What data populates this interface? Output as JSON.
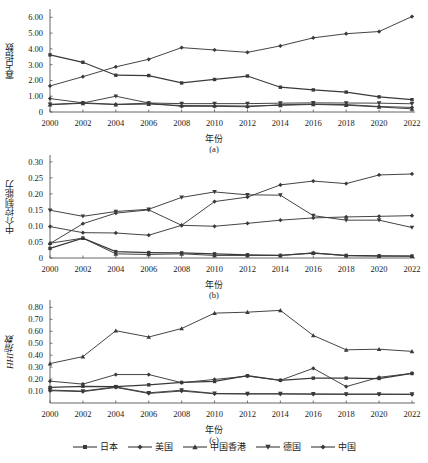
{
  "figure": {
    "background": "#ffffff",
    "line_color": "#3a3a3a",
    "axis_color": "#555555"
  },
  "legend": {
    "position": "bottom-center",
    "items": [
      {
        "label": "日本",
        "marker": "square",
        "series_key": "japan"
      },
      {
        "label": "美国",
        "marker": "diamond",
        "series_key": "usa"
      },
      {
        "label": "中国香港",
        "marker": "triangle-up",
        "series_key": "hongkong"
      },
      {
        "label": "德国",
        "marker": "triangle-down",
        "series_key": "germany"
      },
      {
        "label": "中国",
        "marker": "diamond",
        "series_key": "china"
      }
    ]
  },
  "chart_data": [
    {
      "id": "a",
      "type": "line",
      "title": "",
      "subplot_label": "(a)",
      "xlabel": "年份",
      "ylabel": "寡占指数",
      "ylabel_italic": false,
      "grid": false,
      "legend_position": "bottom-shared",
      "x": [
        2000,
        2002,
        2004,
        2006,
        2008,
        2010,
        2012,
        2014,
        2016,
        2018,
        2020,
        2022
      ],
      "xtick_labels": [
        "2000",
        "2002",
        "2004",
        "2006",
        "2008",
        "2010",
        "2012",
        "2014",
        "2016",
        "2018",
        "2020",
        "2022"
      ],
      "ylim": [
        0,
        6.4
      ],
      "ytick_values": [
        0,
        1.0,
        2.0,
        3.0,
        4.0,
        5.0,
        6.0
      ],
      "ytick_labels": [
        "0",
        "1.00",
        "2.00",
        "3.00",
        "4.00",
        "5.00",
        "6.00"
      ],
      "series": [
        {
          "name": "日本",
          "key": "japan",
          "marker": "square",
          "values": [
            3.62,
            3.15,
            2.33,
            2.31,
            1.84,
            2.06,
            2.28,
            1.57,
            1.4,
            1.26,
            0.96,
            0.78
          ]
        },
        {
          "name": "美国",
          "key": "usa",
          "marker": "diamond",
          "values": [
            0.85,
            0.58,
            0.49,
            0.56,
            0.36,
            0.36,
            0.33,
            0.46,
            0.5,
            0.47,
            0.35,
            0.29
          ]
        },
        {
          "name": "中国香港",
          "key": "hongkong",
          "marker": "triangle-up",
          "values": [
            0.46,
            0.55,
            0.47,
            0.5,
            0.41,
            0.4,
            0.38,
            0.42,
            0.48,
            0.43,
            0.32,
            0.2
          ]
        },
        {
          "name": "德国",
          "key": "germany",
          "marker": "triangle-down",
          "values": [
            0.49,
            0.57,
            1.0,
            0.57,
            0.53,
            0.53,
            0.53,
            0.56,
            0.58,
            0.57,
            0.56,
            0.52
          ]
        },
        {
          "name": "中国",
          "key": "china",
          "marker": "diamond",
          "values": [
            1.65,
            2.24,
            2.86,
            3.34,
            4.08,
            3.93,
            3.78,
            4.19,
            4.7,
            4.96,
            5.1,
            6.05
          ]
        }
      ]
    },
    {
      "id": "b",
      "type": "line",
      "title": "",
      "subplot_label": "(b)",
      "xlabel": "年份",
      "ylabel": "中介控制能力",
      "ylabel_italic": false,
      "grid": false,
      "legend_position": "bottom-shared",
      "x": [
        2000,
        2002,
        2004,
        2006,
        2008,
        2010,
        2012,
        2014,
        2016,
        2018,
        2020,
        2022
      ],
      "xtick_labels": [
        "2000",
        "2002",
        "2004",
        "2006",
        "2008",
        "2010",
        "2012",
        "2014",
        "2016",
        "2018",
        "2020",
        "2022"
      ],
      "ylim": [
        0,
        0.315
      ],
      "ytick_values": [
        0,
        0.05,
        0.1,
        0.15,
        0.2,
        0.25,
        0.3
      ],
      "ytick_labels": [
        "0",
        "0.05",
        "0.10",
        "0.15",
        "0.20",
        "0.25",
        "0.30"
      ],
      "series": [
        {
          "name": "日本",
          "key": "japan",
          "marker": "square",
          "values": [
            0.03,
            0.062,
            0.02,
            0.017,
            0.016,
            0.013,
            0.01,
            0.008,
            0.015,
            0.008,
            0.007,
            0.006
          ]
        },
        {
          "name": "美国",
          "key": "usa",
          "marker": "diamond",
          "values": [
            0.098,
            0.079,
            0.078,
            0.071,
            0.102,
            0.099,
            0.108,
            0.118,
            0.125,
            0.128,
            0.13,
            0.132
          ]
        },
        {
          "name": "中国香港",
          "key": "hongkong",
          "marker": "triangle-up",
          "values": [
            0.046,
            0.062,
            0.013,
            0.011,
            0.013,
            0.008,
            0.008,
            0.008,
            0.016,
            0.007,
            0.006,
            0.006
          ]
        },
        {
          "name": "德国",
          "key": "germany",
          "marker": "triangle-down",
          "values": [
            0.149,
            0.13,
            0.145,
            0.152,
            0.189,
            0.206,
            0.197,
            0.196,
            0.132,
            0.118,
            0.118,
            0.095
          ]
        },
        {
          "name": "中国",
          "key": "china",
          "marker": "diamond",
          "values": [
            0.045,
            0.107,
            0.14,
            0.15,
            0.102,
            0.176,
            0.19,
            0.228,
            0.24,
            0.232,
            0.259,
            0.262
          ]
        }
      ]
    },
    {
      "id": "c",
      "type": "line",
      "title": "",
      "subplot_label": "(c)",
      "xlabel": "年份",
      "ylabel": "HHI指数",
      "ylabel_italic": true,
      "grid": false,
      "legend_position": "bottom-shared",
      "x": [
        2000,
        2002,
        2004,
        2006,
        2008,
        2010,
        2012,
        2014,
        2016,
        2018,
        2020,
        2022
      ],
      "xtick_labels": [
        "2000",
        "2002",
        "2004",
        "2006",
        "2008",
        "2010",
        "2012",
        "2014",
        "2016",
        "2018",
        "2020",
        "2022"
      ],
      "ylim": [
        0,
        0.845
      ],
      "ytick_values": [
        0.1,
        0.2,
        0.3,
        0.4,
        0.5,
        0.6,
        0.7,
        0.8
      ],
      "ytick_labels": [
        "0.10",
        "0.20",
        "0.30",
        "0.40",
        "0.50",
        "0.60",
        "0.70",
        "0.80"
      ],
      "series": [
        {
          "name": "日本",
          "key": "japan",
          "marker": "square",
          "values": [
            0.13,
            0.14,
            0.137,
            0.152,
            0.172,
            0.18,
            0.228,
            0.19,
            0.208,
            0.208,
            0.205,
            0.247
          ]
        },
        {
          "name": "美国",
          "key": "usa",
          "marker": "diamond",
          "values": [
            0.183,
            0.158,
            0.238,
            0.238,
            0.17,
            0.197,
            0.225,
            0.19,
            0.29,
            0.137,
            0.215,
            0.248
          ]
        },
        {
          "name": "中国香港",
          "key": "hongkong",
          "marker": "triangle-up",
          "values": [
            0.33,
            0.388,
            0.605,
            0.552,
            0.623,
            0.752,
            0.76,
            0.775,
            0.565,
            0.445,
            0.45,
            0.432
          ]
        },
        {
          "name": "德国",
          "key": "germany",
          "marker": "triangle-down",
          "values": [
            0.108,
            0.1,
            0.135,
            0.085,
            0.107,
            0.08,
            0.078,
            0.078,
            0.076,
            0.075,
            0.075,
            0.074
          ]
        },
        {
          "name": "中国",
          "key": "china",
          "marker": "diamond",
          "values": [
            0.103,
            0.095,
            0.13,
            0.08,
            0.1,
            0.077,
            0.075,
            0.075,
            0.073,
            0.072,
            0.072,
            0.071
          ]
        }
      ]
    }
  ]
}
